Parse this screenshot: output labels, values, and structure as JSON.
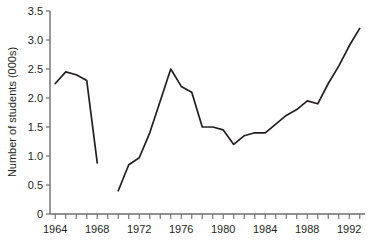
{
  "chart_data": {
    "type": "line",
    "title": "",
    "xlabel": "",
    "ylabel": "Number of students (000s)",
    "xlim": [
      1963.5,
      1993.5
    ],
    "ylim": [
      0,
      3.5
    ],
    "grid": false,
    "legend": "none",
    "y_ticks": [
      "0",
      "0.5",
      "1.0",
      "1.5",
      "2.0",
      "2.5",
      "3.0",
      "3.5"
    ],
    "y_tick_values": [
      0,
      0.5,
      1.0,
      1.5,
      2.0,
      2.5,
      3.0,
      3.5
    ],
    "x_tick_values": [
      1964,
      1965,
      1966,
      1967,
      1968,
      1969,
      1970,
      1971,
      1972,
      1973,
      1974,
      1975,
      1976,
      1977,
      1978,
      1979,
      1980,
      1981,
      1982,
      1983,
      1984,
      1985,
      1986,
      1987,
      1988,
      1989,
      1990,
      1991,
      1992,
      1993
    ],
    "x_tick_labels": [
      "1964",
      "1968",
      "1972",
      "1976",
      "1980",
      "1984",
      "1988",
      "1992"
    ],
    "x_tick_label_values": [
      1964,
      1968,
      1972,
      1976,
      1980,
      1984,
      1988,
      1992
    ],
    "series": [
      {
        "name": "students-segment-1",
        "x": [
          1964,
          1965,
          1966,
          1967,
          1968
        ],
        "values": [
          2.25,
          2.45,
          2.4,
          2.3,
          0.88
        ]
      },
      {
        "name": "students-segment-2",
        "x": [
          1970,
          1971,
          1972,
          1973,
          1974,
          1975,
          1976,
          1977,
          1978,
          1979,
          1980,
          1981,
          1982,
          1983,
          1984,
          1985,
          1986,
          1987,
          1988,
          1989,
          1990,
          1991,
          1992,
          1993
        ],
        "values": [
          0.4,
          0.85,
          0.97,
          1.4,
          1.95,
          2.5,
          2.2,
          2.1,
          1.5,
          1.5,
          1.45,
          1.2,
          1.35,
          1.4,
          1.4,
          1.55,
          1.7,
          1.8,
          1.95,
          1.9,
          2.25,
          2.55,
          2.9,
          3.2
        ]
      }
    ],
    "colors": {
      "line": "#231f20",
      "axis": "#6d6d6d",
      "background": "#ffffff"
    }
  }
}
